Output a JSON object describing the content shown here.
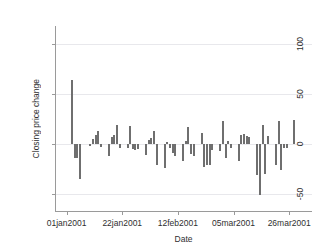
{
  "chart_data": {
    "type": "bar",
    "title": "",
    "subtitle": "",
    "xlabel": "Date",
    "ylabel": "Closing price change",
    "ylim": [
      -68,
      118
    ],
    "yticks": [
      100,
      50,
      0,
      -50
    ],
    "ytick_labels": [
      "100",
      "50",
      "0",
      "-50"
    ],
    "xtick_labels": [
      "01jan2001",
      "22jan2001",
      "12feb2001",
      "05mar2001",
      "26mar2001"
    ],
    "xtick_positions": [
      0,
      21,
      42,
      63,
      84
    ],
    "xlim": [
      -4,
      93
    ],
    "grid": true,
    "legend": "none",
    "series_color": "#6f6f6f",
    "grid_color": "#e8e8ec",
    "axis_color": "#9a9a9a",
    "background": "#ffffff",
    "x": [
      2,
      3,
      4,
      5,
      9,
      10,
      11,
      12,
      13,
      16,
      17,
      18,
      19,
      20,
      23,
      24,
      25,
      26,
      27,
      30,
      31,
      32,
      33,
      34,
      37,
      38,
      39,
      40,
      41,
      44,
      45,
      46,
      47,
      48,
      51,
      52,
      53,
      54,
      55,
      58,
      59,
      60,
      61,
      62,
      65,
      66,
      67,
      68,
      69,
      72,
      73,
      74,
      75,
      76,
      79,
      80,
      81,
      82,
      83,
      86,
      87,
      88,
      89,
      90
    ],
    "values": [
      64,
      -14,
      -14,
      -35,
      -2,
      5,
      9,
      13,
      -3,
      -12,
      7,
      9,
      19,
      -4,
      -4,
      18,
      -5,
      -6,
      -5,
      -11,
      4,
      6,
      13,
      -21,
      -24,
      2,
      -4,
      -9,
      -12,
      -17,
      3,
      17,
      -10,
      -12,
      11,
      -23,
      -21,
      -21,
      -6,
      -7,
      23,
      -14,
      3,
      -4,
      -17,
      9,
      10,
      8,
      7,
      -31,
      -51,
      19,
      -30,
      8,
      -21,
      23,
      -26,
      -4,
      -4,
      24,
      0,
      0,
      0,
      0
    ],
    "categories": [
      "2jan2001",
      "3jan2001",
      "4jan2001",
      "5jan2001",
      "9jan2001",
      "10jan2001",
      "11jan2001",
      "12jan2001",
      "13jan2001",
      "16jan2001",
      "17jan2001",
      "18jan2001",
      "19jan2001",
      "20jan2001",
      "23jan2001",
      "24jan2001",
      "25jan2001",
      "26jan2001",
      "27jan2001",
      "30jan2001",
      "31jan2001",
      "1feb2001",
      "2feb2001",
      "3feb2001",
      "6feb2001",
      "7feb2001",
      "8feb2001",
      "9feb2001",
      "10feb2001",
      "13feb2001",
      "14feb2001",
      "15feb2001",
      "16feb2001",
      "17feb2001",
      "20feb2001",
      "21feb2001",
      "22feb2001",
      "23feb2001",
      "24feb2001",
      "27feb2001",
      "28feb2001",
      "1mar2001",
      "2mar2001",
      "3mar2001",
      "6mar2001",
      "7mar2001",
      "8mar2001",
      "9mar2001",
      "10mar2001",
      "13mar2001",
      "14mar2001",
      "15mar2001",
      "16mar2001",
      "17mar2001",
      "20mar2001",
      "21mar2001",
      "22mar2001",
      "23mar2001",
      "24mar2001",
      "27mar2001",
      "28mar2001",
      "29mar2001",
      "30mar2001",
      "31mar2001"
    ]
  }
}
